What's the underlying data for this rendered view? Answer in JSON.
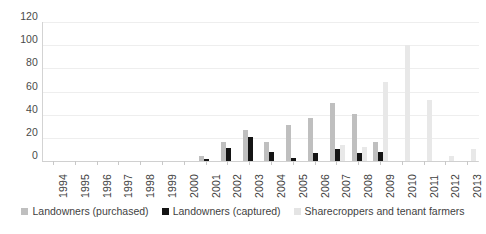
{
  "chart_data": {
    "type": "bar",
    "title": "",
    "subtitle": "",
    "xlabel": "",
    "ylabel": "",
    "ylim": [
      0,
      120
    ],
    "y_ticks": [
      0,
      20,
      40,
      60,
      80,
      100,
      120
    ],
    "grid": true,
    "legend_position": "bottom",
    "categories": [
      "1994",
      "1995",
      "1996",
      "1997",
      "1998",
      "1999",
      "2000",
      "2001",
      "2002",
      "2003",
      "2004",
      "2005",
      "2006",
      "2007",
      "2008",
      "2009",
      "2010",
      "2011",
      "2012",
      "2013"
    ],
    "series": [
      {
        "name": "Landowners (purchased)",
        "color": "#bfbfbf",
        "values": [
          0,
          0,
          0,
          0,
          0,
          0,
          0,
          4,
          16,
          27,
          16,
          31,
          37,
          50,
          41,
          16,
          0,
          0,
          0,
          0
        ]
      },
      {
        "name": "Landowners (captured)",
        "color": "#141414",
        "values": [
          0,
          0,
          0,
          0,
          0,
          0,
          0,
          2,
          11,
          21,
          8,
          3,
          7,
          10,
          7,
          8,
          0,
          0,
          0,
          0
        ]
      },
      {
        "name": "Sharecroppers and tenant farmers",
        "color": "#e8e8e8",
        "values": [
          0,
          0,
          0,
          0,
          0,
          0,
          0,
          0,
          0,
          0,
          0,
          0,
          0,
          14,
          12,
          68,
          100,
          53,
          4,
          10
        ]
      }
    ]
  },
  "legend": {
    "items": [
      {
        "label": "Landowners (purchased)",
        "swatch": "s0"
      },
      {
        "label": "Landowners (captured)",
        "swatch": "s1"
      },
      {
        "label": "Sharecroppers and tenant farmers",
        "swatch": "s2"
      }
    ]
  }
}
